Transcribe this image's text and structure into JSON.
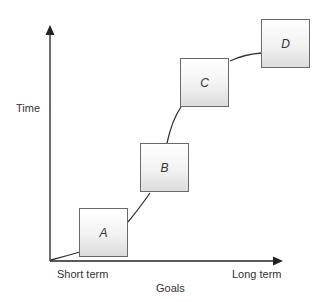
{
  "diagram": {
    "y_axis_label": "Time",
    "x_axis_label": "Goals",
    "x_axis_start_label": "Short term",
    "x_axis_end_label": "Long term",
    "boxes": [
      {
        "label": "A"
      },
      {
        "label": "B"
      },
      {
        "label": "C"
      },
      {
        "label": "D"
      }
    ],
    "colors": {
      "axis": "#222222",
      "box_border": "#6a6a6a",
      "box_fill_top": "#ffffff",
      "box_fill_bottom": "#dcdcdc",
      "curve": "#333333"
    }
  }
}
